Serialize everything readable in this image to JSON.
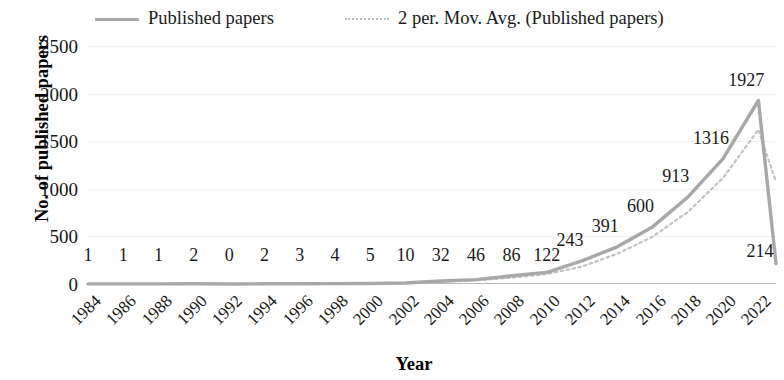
{
  "chart_data": {
    "type": "line",
    "title": "",
    "xlabel": "Year",
    "ylabel": "No. of published papers",
    "ylim": [
      0,
      2500
    ],
    "ytick_labels": [
      "2500",
      "2000",
      "1500",
      "1000",
      "500",
      "0"
    ],
    "ytick_values": [
      2500,
      2000,
      1500,
      1000,
      500,
      0
    ],
    "xtick_labels": [
      "1984",
      "1986",
      "1988",
      "1990",
      "1992",
      "1994",
      "1996",
      "1998",
      "2000",
      "2002",
      "2004",
      "2006",
      "2008",
      "2010",
      "2012",
      "2014",
      "2016",
      "2018",
      "2020",
      "2022"
    ],
    "xlim": [
      1984,
      2023
    ],
    "grid": true,
    "legend_position": "top",
    "legend": [
      {
        "label": "Published papers",
        "style": "solid",
        "color": "#a8a8a8"
      },
      {
        "label": "2 per. Mov. Avg. (Published papers)",
        "style": "dotted",
        "color": "#bdbdbd"
      }
    ],
    "series": [
      {
        "name": "Published papers",
        "x": [
          1984,
          1986,
          1988,
          1990,
          1992,
          1994,
          1996,
          1998,
          2000,
          2002,
          2004,
          2006,
          2008,
          2010,
          2012,
          2014,
          2016,
          2018,
          2020,
          2022,
          2023
        ],
        "values": [
          1,
          1,
          1,
          2,
          0,
          2,
          3,
          4,
          5,
          10,
          32,
          46,
          86,
          122,
          243,
          391,
          600,
          913,
          1316,
          1927,
          214
        ]
      },
      {
        "name": "2 per. Mov. Avg. (Published papers)",
        "x": [
          1986,
          1988,
          1990,
          1992,
          1994,
          1996,
          1998,
          2000,
          2002,
          2004,
          2006,
          2008,
          2010,
          2012,
          2014,
          2016,
          2018,
          2020,
          2022,
          2023
        ],
        "values": [
          1,
          1,
          1.5,
          1,
          1,
          2.5,
          3.5,
          4.5,
          7.5,
          21,
          39,
          66,
          104,
          182.5,
          317,
          495.5,
          756.5,
          1114.5,
          1621.5,
          1070.5
        ]
      }
    ],
    "data_labels": [
      {
        "text": "1",
        "x": 1984,
        "y": 1
      },
      {
        "text": "1",
        "x": 1986,
        "y": 1
      },
      {
        "text": "1",
        "x": 1988,
        "y": 1
      },
      {
        "text": "2",
        "x": 1990,
        "y": 2
      },
      {
        "text": "0",
        "x": 1992,
        "y": 0
      },
      {
        "text": "2",
        "x": 1994,
        "y": 2
      },
      {
        "text": "3",
        "x": 1996,
        "y": 3
      },
      {
        "text": "4",
        "x": 1998,
        "y": 4
      },
      {
        "text": "5",
        "x": 2000,
        "y": 5
      },
      {
        "text": "10",
        "x": 2002,
        "y": 10
      },
      {
        "text": "32",
        "x": 2004,
        "y": 32
      },
      {
        "text": "46",
        "x": 2006,
        "y": 46
      },
      {
        "text": "86",
        "x": 2008,
        "y": 86
      },
      {
        "text": "122",
        "x": 2010,
        "y": 122
      },
      {
        "text": "243",
        "x": 2012,
        "y": 243
      },
      {
        "text": "391",
        "x": 2014,
        "y": 391
      },
      {
        "text": "600",
        "x": 2016,
        "y": 600
      },
      {
        "text": "913",
        "x": 2018,
        "y": 913
      },
      {
        "text": "1316",
        "x": 2020,
        "y": 1316
      },
      {
        "text": "1927",
        "x": 2022,
        "y": 1927
      },
      {
        "text": "214",
        "x": 2023,
        "y": 214
      }
    ]
  }
}
